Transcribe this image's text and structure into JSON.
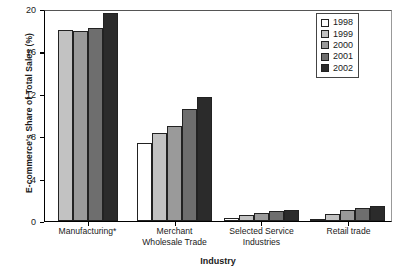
{
  "chart_data": {
    "type": "bar",
    "title": "",
    "xlabel": "Industry",
    "ylabel": "E-commerce's Share of Total Sales (%)",
    "categories": [
      "Manufacturing*",
      "Merchant Wholesale Trade",
      "Selected Service Industries",
      "Retail trade"
    ],
    "category_lines": [
      [
        "Manufacturing*"
      ],
      [
        "Merchant",
        "Wholesale Trade"
      ],
      [
        "Selected Service",
        "Industries"
      ],
      [
        "Retail trade"
      ]
    ],
    "series": [
      {
        "name": "1998",
        "color": "#ffffff",
        "values": [
          null,
          7.4,
          0.3,
          0.2
        ]
      },
      {
        "name": "1999",
        "color": "#c2c2c2",
        "values": [
          18.0,
          8.3,
          0.6,
          0.7
        ]
      },
      {
        "name": "2000",
        "color": "#9a9a9a",
        "values": [
          17.9,
          9.0,
          0.8,
          1.0
        ]
      },
      {
        "name": "2001",
        "color": "#6e6e6e",
        "values": [
          18.2,
          10.6,
          0.9,
          1.2
        ]
      },
      {
        "name": "2002",
        "color": "#2b2b2b",
        "values": [
          19.6,
          11.7,
          1.0,
          1.4
        ]
      }
    ],
    "ylim": [
      0,
      20
    ],
    "yticks": [
      0,
      4,
      8,
      12,
      16,
      20
    ],
    "ytick_labels": [
      "0",
      "4",
      "8",
      "12",
      "16",
      "20"
    ],
    "grid": false,
    "legend_position": "top-right",
    "legend_entries": [
      "1998",
      "1999",
      "2000",
      "2001",
      "2002"
    ],
    "footnote": "*"
  }
}
